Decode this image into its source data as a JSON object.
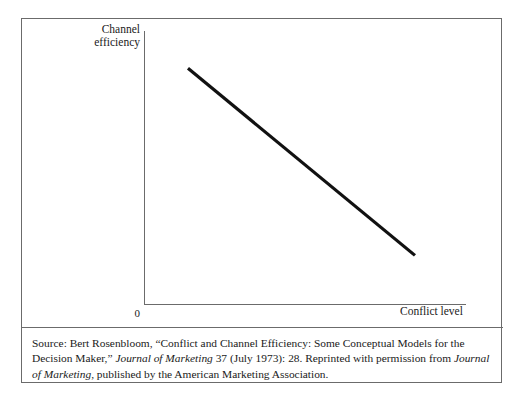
{
  "figure": {
    "caption": {
      "prefix": "Source: Bert Rosenbloom, “Conflict and Channel Efficiency: Some Conceptual Models for the Decision Maker,” ",
      "journal_1": "Journal of Marketing",
      "middle": " 37 (July 1973): 28. Reprinted with permission from ",
      "journal_2": "Journal of Marketing",
      "suffix": ", published by the American Marketing Association."
    }
  },
  "chart_data": {
    "type": "line",
    "title": "",
    "xlabel": "Conflict level",
    "ylabel_line1": "Channel",
    "ylabel_line2": "efficiency",
    "origin_label": "0",
    "x": [
      0.135,
      0.84
    ],
    "y": [
      0.865,
      0.18
    ],
    "series": [
      {
        "name": "Channel efficiency vs. conflict level",
        "points": [
          {
            "x": 0.135,
            "y": 0.865
          },
          {
            "x": 0.84,
            "y": 0.18
          }
        ]
      }
    ],
    "xlim": [
      0,
      1
    ],
    "ylim": [
      0,
      1
    ],
    "grid": false,
    "legend": "none",
    "line_color": "#111111",
    "axis_color": "#6b6b6b",
    "line_width": 3.2,
    "annotation": "Channel efficiency declines linearly as conflict level increases."
  }
}
